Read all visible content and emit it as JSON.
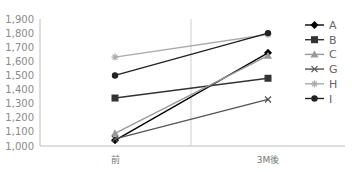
{
  "chart_data": {
    "type": "line",
    "title": "",
    "xlabel": "",
    "ylabel": "",
    "categories": [
      "前",
      "3M後"
    ],
    "ylim": [
      1000,
      1900
    ],
    "yticks": [
      "1,000",
      "1,100",
      "1,200",
      "1,300",
      "1,400",
      "1,500",
      "1,600",
      "1,700",
      "1,800",
      "1,900"
    ],
    "legend_position": "right",
    "grid": false,
    "series": [
      {
        "name": "A",
        "values": [
          1040,
          1660
        ],
        "color": "#000000",
        "marker": "diamond"
      },
      {
        "name": "B",
        "values": [
          1340,
          1480
        ],
        "color": "#333333",
        "marker": "square"
      },
      {
        "name": "C",
        "values": [
          1090,
          1640
        ],
        "color": "#999999",
        "marker": "triangle"
      },
      {
        "name": "G",
        "values": [
          1050,
          1330
        ],
        "color": "#555555",
        "marker": "x"
      },
      {
        "name": "H",
        "values": [
          1630,
          1790
        ],
        "color": "#aaaaaa",
        "marker": "star"
      },
      {
        "name": "I",
        "values": [
          1500,
          1800
        ],
        "color": "#222222",
        "marker": "circle"
      }
    ]
  }
}
